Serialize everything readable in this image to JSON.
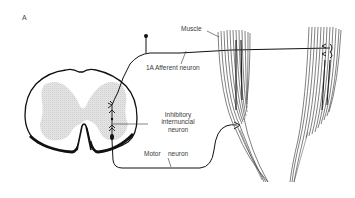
{
  "figure": {
    "panel_label": "A",
    "labels": {
      "muscle": "Muscle",
      "afferent": "1A Afferent neuron",
      "inhibitory_line1": "Inhibitory",
      "inhibitory_line2": "internuncial",
      "inhibitory_line3": "neuron",
      "motor": "Motor",
      "motor_neuron": "neuron"
    },
    "colors": {
      "ink": "#1a1a1a",
      "grey_matter": "#d4d4d4",
      "muscle_fibres": "#555555",
      "text": "#3a3a3a"
    },
    "elements": [
      {
        "id": "spinal-cord-section",
        "desc": "Cross-section of spinal cord with stippled grey matter"
      },
      {
        "id": "afferent-neuron",
        "desc": "1A afferent fibre from muscle spindle entering dorsal cord"
      },
      {
        "id": "inhibitory-interneuron",
        "desc": "Inhibitory internuncial neuron in grey matter"
      },
      {
        "id": "motor-neuron",
        "desc": "Motor neuron exiting ventral cord to left muscle"
      },
      {
        "id": "muscle-left",
        "desc": "Agonist muscle bundle"
      },
      {
        "id": "muscle-right",
        "desc": "Muscle bundle with spindle endings"
      }
    ]
  }
}
